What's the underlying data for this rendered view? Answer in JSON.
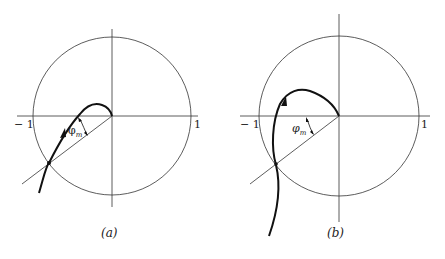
{
  "figures": [
    {
      "id": "a",
      "caption": "(a)",
      "axis_labels": {
        "neg_one": "− 1",
        "pos_one": "1"
      },
      "angle_label": {
        "symbol": "φ",
        "subscript": "m"
      },
      "description": "Nyquist plot inside unit circle; phase margin angle between negative real axis and radial line through unit-circle crossing"
    },
    {
      "id": "b",
      "caption": "(b)",
      "axis_labels": {
        "neg_one": "− 1",
        "pos_one": "1"
      },
      "angle_label": {
        "symbol": "φ",
        "subscript": "m"
      },
      "description": "Nyquist plot with larger loop; phase margin angle shown"
    }
  ],
  "colors": {
    "line": "#333333",
    "curve": "#111111",
    "background": "#ffffff"
  }
}
